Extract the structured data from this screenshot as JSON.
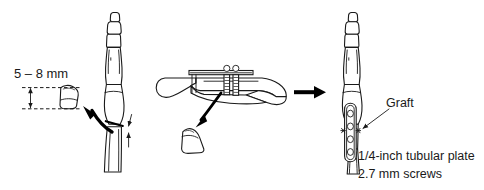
{
  "figure": {
    "type": "surgical-technique-line-drawing",
    "background_color": "#ffffff",
    "ink_color": "#1a1a1a",
    "panels": [
      {
        "id": "panel-left",
        "name": "graft-harvest-panel",
        "description": "Vertical finger bone with wedge osteotomy; harvested bone graft shown at left with dimension callout"
      },
      {
        "id": "panel-center",
        "name": "graft-removal-panel",
        "description": "Horizontal bone held by clamp; wedge graft fragment removed, indicated by curved arrow"
      },
      {
        "id": "panel-right",
        "name": "fixation-panel",
        "description": "Reconstructed bone fixed with tubular plate and screws; graft in place"
      }
    ]
  },
  "labels": {
    "dimension": "5 – 8 mm",
    "graft": "Graft",
    "plate": "1/4-inch tubular plate",
    "screws": "2.7 mm screws"
  },
  "annotations": {
    "transition_arrow": "right-arrow",
    "graft_leader_arrow": "diagonal-leader-arrow",
    "harvest_arrow": "curved-arrow-up-left",
    "removal_arrow": "curved-arrow-down-left",
    "gap_markers": "opposing-arrows"
  },
  "hardware": {
    "plate_hole_count": 4,
    "clamp_pin_count": 2
  }
}
